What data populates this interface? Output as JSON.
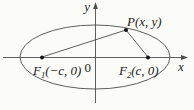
{
  "figure": {
    "colors": {
      "background": "#fbfbf8",
      "line": "#4d4d4d",
      "point": "#121212",
      "text": "#1c1c1c"
    },
    "labels": {
      "y_axis": "y",
      "x_axis": "x",
      "origin": "0",
      "p": {
        "name": "P",
        "coords": "(x, y)"
      },
      "f1": {
        "name": "F",
        "sub": "1",
        "coords": "(−c, 0)"
      },
      "f2": {
        "name": "F",
        "sub": "2",
        "coords": "(c, 0)"
      }
    }
  }
}
